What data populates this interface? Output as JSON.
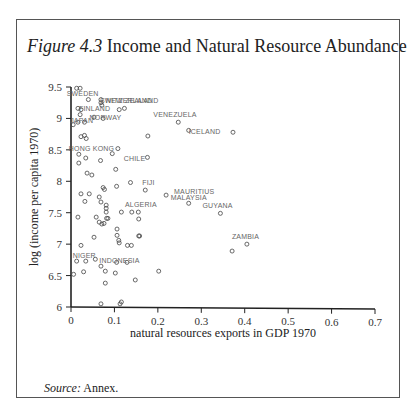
{
  "header": {
    "running_head": ""
  },
  "figure": {
    "number": "Figure 4.3",
    "title": "Income and Natural Resource Abundance",
    "source_label": "Source:",
    "source_text": " Annex."
  },
  "chart_data": {
    "type": "scatter",
    "title": "Income and Natural Resource Abundance",
    "xlabel": "natural resources exports in GDP 1970",
    "ylabel": "log (income per capita 1970)",
    "xlim": [
      0,
      0.7
    ],
    "ylim": [
      6,
      9.5
    ],
    "xticks": [
      "0",
      "0.1",
      "0.2",
      "0.3",
      "0.4",
      "0.5",
      "0.6",
      "0.7"
    ],
    "yticks": [
      "6",
      "6.5",
      "7",
      "7.5",
      "8",
      "8.5",
      "9",
      "9.5"
    ],
    "grid": false,
    "legend": null,
    "labeled_points": [
      {
        "label": "SWEDEN",
        "x": 0.013,
        "y": 9.48
      },
      {
        "label": "SWITZERLAND",
        "x": 0.069,
        "y": 9.3
      },
      {
        "label": "NEW ZEALAND",
        "x": 0.071,
        "y": 9.25
      },
      {
        "label": "FINLAND",
        "x": 0.023,
        "y": 9.12
      },
      {
        "label": "NORWAY",
        "x": 0.052,
        "y": 9.0
      },
      {
        "label": "JAPAN",
        "x": 0.005,
        "y": 8.9
      },
      {
        "label": "VENEZUELA",
        "x": 0.247,
        "y": 8.94
      },
      {
        "label": "ICELAND",
        "x": 0.271,
        "y": 8.81
      },
      {
        "label": "HONG KONG",
        "x": 0.018,
        "y": 8.4
      },
      {
        "label": "CHILE",
        "x": 0.103,
        "y": 8.2
      },
      {
        "label": "FIJI",
        "x": 0.171,
        "y": 7.86
      },
      {
        "label": "MAURITIUS",
        "x": 0.219,
        "y": 7.78
      },
      {
        "label": "MALAYSIA",
        "x": 0.271,
        "y": 7.65
      },
      {
        "label": "ALGERIA",
        "x": 0.152,
        "y": 7.51
      },
      {
        "label": "GUYANA",
        "x": 0.344,
        "y": 7.49
      },
      {
        "label": "ZAMBIA",
        "x": 0.405,
        "y": 7.0
      },
      {
        "label": "NIGER",
        "x": 0.013,
        "y": 6.7
      },
      {
        "label": "INDONESIA",
        "x": 0.056,
        "y": 6.73
      }
    ],
    "points": [
      [
        0.013,
        9.48
      ],
      [
        0.021,
        9.48
      ],
      [
        0.04,
        9.3
      ],
      [
        0.069,
        9.3
      ],
      [
        0.069,
        9.25
      ],
      [
        0.071,
        9.21
      ],
      [
        0.016,
        9.16
      ],
      [
        0.023,
        9.14
      ],
      [
        0.111,
        9.14
      ],
      [
        0.123,
        9.16
      ],
      [
        0.021,
        9.06
      ],
      [
        0.053,
        9.02
      ],
      [
        0.074,
        9.0
      ],
      [
        0.005,
        8.9
      ],
      [
        0.016,
        8.94
      ],
      [
        0.031,
        8.94
      ],
      [
        0.023,
        8.71
      ],
      [
        0.031,
        8.73
      ],
      [
        0.035,
        8.68
      ],
      [
        0.108,
        8.52
      ],
      [
        0.095,
        8.44
      ],
      [
        0.018,
        8.43
      ],
      [
        0.018,
        8.29
      ],
      [
        0.034,
        8.37
      ],
      [
        0.068,
        8.33
      ],
      [
        0.103,
        8.19
      ],
      [
        0.037,
        8.13
      ],
      [
        0.048,
        8.1
      ],
      [
        0.074,
        7.9
      ],
      [
        0.077,
        7.87
      ],
      [
        0.105,
        7.92
      ],
      [
        0.137,
        7.98
      ],
      [
        0.023,
        7.8
      ],
      [
        0.042,
        7.8
      ],
      [
        0.032,
        7.68
      ],
      [
        0.065,
        7.75
      ],
      [
        0.069,
        7.67
      ],
      [
        0.081,
        7.62
      ],
      [
        0.081,
        7.57
      ],
      [
        0.081,
        7.51
      ],
      [
        0.116,
        7.51
      ],
      [
        0.14,
        7.51
      ],
      [
        0.016,
        7.43
      ],
      [
        0.058,
        7.43
      ],
      [
        0.082,
        7.41
      ],
      [
        0.156,
        7.4
      ],
      [
        0.065,
        7.35
      ],
      [
        0.071,
        7.32
      ],
      [
        0.076,
        7.33
      ],
      [
        0.085,
        7.41
      ],
      [
        0.106,
        7.24
      ],
      [
        0.158,
        7.13
      ],
      [
        0.053,
        7.11
      ],
      [
        0.106,
        7.14
      ],
      [
        0.11,
        7.06
      ],
      [
        0.111,
        7.02
      ],
      [
        0.139,
        6.98
      ],
      [
        0.023,
        6.98
      ],
      [
        0.013,
        6.73
      ],
      [
        0.034,
        6.73
      ],
      [
        0.056,
        6.76
      ],
      [
        0.105,
        6.71
      ],
      [
        0.129,
        6.71
      ],
      [
        0.069,
        6.65
      ],
      [
        0.079,
        6.57
      ],
      [
        0.029,
        6.56
      ],
      [
        0.006,
        6.52
      ],
      [
        0.102,
        6.54
      ],
      [
        0.148,
        6.43
      ],
      [
        0.079,
        6.38
      ],
      [
        0.069,
        6.05
      ],
      [
        0.113,
        6.05
      ],
      [
        0.116,
        6.08
      ],
      [
        0.177,
        8.72
      ],
      [
        0.247,
        8.94
      ],
      [
        0.271,
        8.81
      ],
      [
        0.176,
        8.38
      ],
      [
        0.171,
        7.86
      ],
      [
        0.219,
        7.78
      ],
      [
        0.271,
        7.65
      ],
      [
        0.155,
        7.51
      ],
      [
        0.344,
        7.49
      ],
      [
        0.373,
        8.78
      ],
      [
        0.405,
        7.0
      ],
      [
        0.371,
        6.89
      ],
      [
        0.202,
        6.57
      ],
      [
        0.156,
        7.13
      ],
      [
        0.13,
        6.98
      ]
    ]
  }
}
